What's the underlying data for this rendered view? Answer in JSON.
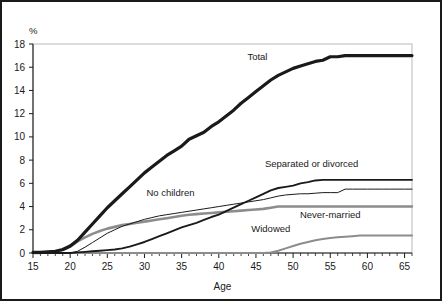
{
  "chart_data": {
    "type": "line",
    "title": "",
    "xlabel": "Age",
    "ylabel": "",
    "unit_label": "%",
    "xlim": [
      15,
      66
    ],
    "ylim": [
      0,
      18
    ],
    "xticks": [
      15,
      20,
      25,
      30,
      35,
      40,
      45,
      50,
      55,
      60,
      65
    ],
    "yticks": [
      0,
      2,
      4,
      6,
      8,
      10,
      12,
      14,
      16,
      18
    ],
    "grid": false,
    "legend_position": "inline-annotations",
    "series": [
      {
        "name": "Total",
        "label": "Total",
        "color": "#1a1a1a",
        "width": 3.2,
        "label_x": 45.2,
        "label_y": 16.6,
        "x": [
          15,
          16,
          17,
          18,
          19,
          20,
          21,
          22,
          23,
          24,
          25,
          26,
          27,
          28,
          29,
          30,
          31,
          32,
          33,
          34,
          35,
          36,
          37,
          38,
          39,
          40,
          41,
          42,
          43,
          44,
          45,
          46,
          47,
          48,
          49,
          50,
          51,
          52,
          53,
          54,
          55,
          56,
          57,
          58,
          59,
          60,
          61,
          62,
          63,
          64,
          65,
          66
        ],
        "y": [
          0.05,
          0.05,
          0.1,
          0.15,
          0.3,
          0.6,
          1.1,
          1.8,
          2.5,
          3.2,
          3.9,
          4.5,
          5.1,
          5.7,
          6.3,
          6.9,
          7.4,
          7.9,
          8.4,
          8.8,
          9.2,
          9.8,
          10.1,
          10.4,
          10.9,
          11.3,
          11.8,
          12.3,
          12.9,
          13.4,
          13.9,
          14.4,
          14.9,
          15.3,
          15.6,
          15.9,
          16.1,
          16.3,
          16.5,
          16.6,
          16.9,
          16.9,
          17.0,
          17.0,
          17.0,
          17.0,
          17.0,
          17.0,
          17.0,
          17.0,
          17.0,
          17.0
        ]
      },
      {
        "name": "Separated or divorced",
        "label": "Separated or divorced",
        "color": "#1a1a1a",
        "width": 1.9,
        "label_x": 52.5,
        "label_y": 7.4,
        "x": [
          15,
          16,
          17,
          18,
          19,
          20,
          21,
          22,
          23,
          24,
          25,
          26,
          27,
          28,
          29,
          30,
          31,
          32,
          33,
          34,
          35,
          36,
          37,
          38,
          39,
          40,
          41,
          42,
          43,
          44,
          45,
          46,
          47,
          48,
          49,
          50,
          51,
          52,
          53,
          54,
          55,
          56,
          57,
          58,
          59,
          60,
          61,
          62,
          63,
          64,
          65,
          66
        ],
        "y": [
          0.0,
          0.0,
          0.0,
          0.0,
          0.0,
          0.0,
          0.05,
          0.1,
          0.15,
          0.2,
          0.25,
          0.3,
          0.4,
          0.55,
          0.75,
          0.95,
          1.2,
          1.45,
          1.7,
          1.95,
          2.2,
          2.4,
          2.6,
          2.85,
          3.1,
          3.3,
          3.6,
          3.9,
          4.2,
          4.5,
          4.8,
          5.1,
          5.4,
          5.6,
          5.7,
          5.8,
          6.0,
          6.1,
          6.25,
          6.3,
          6.3,
          6.3,
          6.3,
          6.3,
          6.3,
          6.3,
          6.3,
          6.3,
          6.3,
          6.3,
          6.3,
          6.3
        ]
      },
      {
        "name": "No children",
        "label": "No children",
        "color": "#1a1a1a",
        "width": 1.0,
        "label_x": 33.5,
        "label_y": 4.9,
        "x": [
          15,
          16,
          17,
          18,
          19,
          20,
          21,
          22,
          23,
          24,
          25,
          26,
          27,
          28,
          29,
          30,
          31,
          32,
          33,
          34,
          35,
          36,
          37,
          38,
          39,
          40,
          41,
          42,
          43,
          44,
          45,
          46,
          47,
          48,
          49,
          50,
          51,
          52,
          53,
          54,
          55,
          56,
          57,
          58,
          59,
          60,
          61,
          62,
          63,
          64,
          65,
          66
        ],
        "y": [
          0.0,
          0.0,
          0.0,
          0.0,
          0.0,
          0.0,
          0.15,
          0.5,
          0.9,
          1.3,
          1.7,
          2.0,
          2.3,
          2.5,
          2.7,
          2.9,
          3.05,
          3.2,
          3.3,
          3.4,
          3.5,
          3.6,
          3.7,
          3.8,
          3.9,
          4.0,
          4.1,
          4.2,
          4.3,
          4.4,
          4.5,
          4.6,
          4.75,
          4.9,
          5.0,
          5.05,
          5.1,
          5.1,
          5.15,
          5.2,
          5.2,
          5.2,
          5.5,
          5.5,
          5.5,
          5.5,
          5.5,
          5.5,
          5.5,
          5.5,
          5.5,
          5.5
        ]
      },
      {
        "name": "Never-married",
        "label": "Never-married",
        "color": "#8c8c8c",
        "width": 2.6,
        "label_x": 55.0,
        "label_y": 3.0,
        "x": [
          15,
          16,
          17,
          18,
          19,
          20,
          21,
          22,
          23,
          24,
          25,
          26,
          27,
          28,
          29,
          30,
          31,
          32,
          33,
          34,
          35,
          36,
          37,
          38,
          39,
          40,
          41,
          42,
          43,
          44,
          45,
          46,
          47,
          48,
          49,
          50,
          51,
          52,
          53,
          54,
          55,
          56,
          57,
          58,
          59,
          60,
          61,
          62,
          63,
          64,
          65,
          66
        ],
        "y": [
          0.0,
          0.0,
          0.05,
          0.1,
          0.25,
          0.55,
          1.0,
          1.35,
          1.65,
          1.9,
          2.1,
          2.25,
          2.4,
          2.5,
          2.6,
          2.7,
          2.8,
          2.9,
          3.0,
          3.1,
          3.2,
          3.3,
          3.35,
          3.4,
          3.45,
          3.5,
          3.55,
          3.6,
          3.65,
          3.7,
          3.75,
          3.8,
          3.9,
          4.0,
          4.0,
          4.0,
          4.0,
          4.0,
          4.0,
          4.0,
          4.0,
          4.0,
          4.0,
          4.0,
          4.0,
          4.0,
          4.0,
          4.0,
          4.0,
          4.0,
          4.0,
          4.0
        ]
      },
      {
        "name": "Widowed",
        "label": "Widowed",
        "color": "#8c8c8c",
        "width": 2.0,
        "label_x": 47.0,
        "label_y": 1.85,
        "x": [
          15,
          16,
          17,
          18,
          19,
          20,
          21,
          22,
          23,
          24,
          25,
          26,
          27,
          28,
          29,
          30,
          31,
          32,
          33,
          34,
          35,
          36,
          37,
          38,
          39,
          40,
          41,
          42,
          43,
          44,
          45,
          46,
          47,
          48,
          49,
          50,
          51,
          52,
          53,
          54,
          55,
          56,
          57,
          58,
          59,
          60,
          61,
          62,
          63,
          64,
          65,
          66
        ],
        "y": [
          0.0,
          0.0,
          0.0,
          0.0,
          0.0,
          0.0,
          0.0,
          0.0,
          0.0,
          0.0,
          0.0,
          0.0,
          0.0,
          0.0,
          0.0,
          0.0,
          0.0,
          0.0,
          0.0,
          0.0,
          0.0,
          0.0,
          0.0,
          0.0,
          0.0,
          0.0,
          0.0,
          0.0,
          0.0,
          0.0,
          0.0,
          0.0,
          0.05,
          0.2,
          0.4,
          0.6,
          0.8,
          0.95,
          1.1,
          1.2,
          1.3,
          1.35,
          1.4,
          1.45,
          1.5,
          1.5,
          1.5,
          1.5,
          1.5,
          1.5,
          1.5,
          1.5
        ]
      }
    ]
  }
}
